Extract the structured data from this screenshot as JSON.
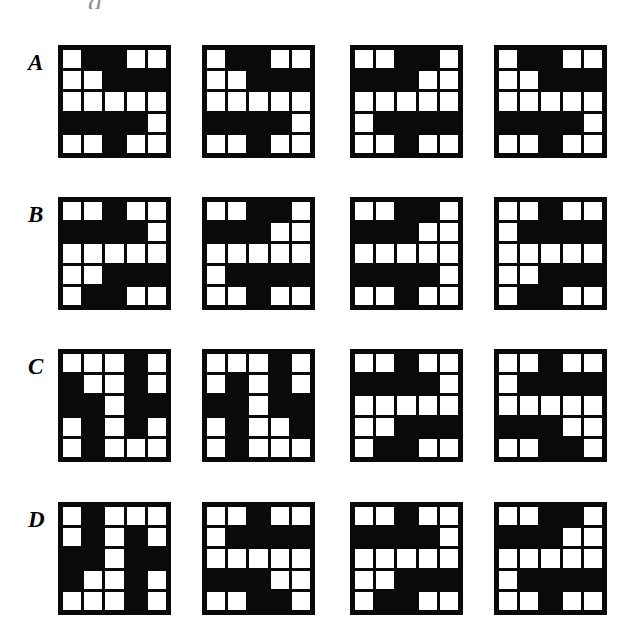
{
  "page": {
    "background_color": "#ffffff",
    "cell_white_color": "#ffffff",
    "cell_black_color": "#0a0a0a",
    "top_fragment_text": "g",
    "grid_rows": 5,
    "grid_cols": 5
  },
  "rows": [
    {
      "label": "A",
      "grids": [
        {
          "name": "grid-a-1",
          "matrix": [
            [
              "w",
              "b",
              "b",
              "w",
              "w"
            ],
            [
              "w",
              "w",
              "b",
              "b",
              "b"
            ],
            [
              "w",
              "w",
              "w",
              "w",
              "w"
            ],
            [
              "b",
              "b",
              "b",
              "b",
              "w"
            ],
            [
              "w",
              "w",
              "b",
              "w",
              "w"
            ]
          ]
        },
        {
          "name": "grid-a-2",
          "matrix": [
            [
              "w",
              "b",
              "b",
              "w",
              "w"
            ],
            [
              "w",
              "w",
              "b",
              "b",
              "b"
            ],
            [
              "w",
              "w",
              "w",
              "w",
              "w"
            ],
            [
              "b",
              "b",
              "b",
              "b",
              "w"
            ],
            [
              "w",
              "w",
              "b",
              "w",
              "w"
            ]
          ]
        },
        {
          "name": "grid-a-3",
          "matrix": [
            [
              "w",
              "w",
              "b",
              "b",
              "w"
            ],
            [
              "b",
              "b",
              "b",
              "w",
              "w"
            ],
            [
              "w",
              "w",
              "w",
              "w",
              "w"
            ],
            [
              "w",
              "b",
              "b",
              "b",
              "b"
            ],
            [
              "w",
              "w",
              "b",
              "w",
              "w"
            ]
          ]
        },
        {
          "name": "grid-a-4",
          "matrix": [
            [
              "w",
              "b",
              "b",
              "w",
              "w"
            ],
            [
              "w",
              "w",
              "b",
              "b",
              "b"
            ],
            [
              "w",
              "w",
              "w",
              "w",
              "w"
            ],
            [
              "b",
              "b",
              "b",
              "b",
              "w"
            ],
            [
              "w",
              "w",
              "b",
              "w",
              "w"
            ]
          ]
        }
      ]
    },
    {
      "label": "B",
      "grids": [
        {
          "name": "grid-b-1",
          "matrix": [
            [
              "w",
              "w",
              "b",
              "w",
              "w"
            ],
            [
              "b",
              "b",
              "b",
              "b",
              "w"
            ],
            [
              "w",
              "w",
              "w",
              "w",
              "w"
            ],
            [
              "w",
              "w",
              "b",
              "b",
              "b"
            ],
            [
              "w",
              "b",
              "b",
              "w",
              "w"
            ]
          ]
        },
        {
          "name": "grid-b-2",
          "matrix": [
            [
              "w",
              "w",
              "b",
              "b",
              "w"
            ],
            [
              "b",
              "b",
              "b",
              "w",
              "w"
            ],
            [
              "w",
              "w",
              "w",
              "w",
              "w"
            ],
            [
              "w",
              "b",
              "b",
              "b",
              "b"
            ],
            [
              "w",
              "w",
              "b",
              "w",
              "w"
            ]
          ]
        },
        {
          "name": "grid-b-3",
          "matrix": [
            [
              "w",
              "w",
              "b",
              "b",
              "w"
            ],
            [
              "b",
              "b",
              "b",
              "w",
              "w"
            ],
            [
              "w",
              "w",
              "w",
              "w",
              "w"
            ],
            [
              "b",
              "b",
              "b",
              "b",
              "w"
            ],
            [
              "w",
              "w",
              "b",
              "w",
              "w"
            ]
          ]
        },
        {
          "name": "grid-b-4",
          "matrix": [
            [
              "w",
              "w",
              "b",
              "w",
              "w"
            ],
            [
              "w",
              "b",
              "b",
              "b",
              "b"
            ],
            [
              "w",
              "w",
              "w",
              "w",
              "w"
            ],
            [
              "w",
              "w",
              "b",
              "b",
              "b"
            ],
            [
              "w",
              "b",
              "b",
              "w",
              "w"
            ]
          ]
        }
      ]
    },
    {
      "label": "C",
      "grids": [
        {
          "name": "grid-c-1",
          "matrix": [
            [
              "w",
              "w",
              "w",
              "b",
              "w"
            ],
            [
              "b",
              "w",
              "w",
              "b",
              "w"
            ],
            [
              "b",
              "b",
              "w",
              "b",
              "b"
            ],
            [
              "w",
              "b",
              "w",
              "b",
              "w"
            ],
            [
              "w",
              "b",
              "w",
              "w",
              "w"
            ]
          ]
        },
        {
          "name": "grid-c-2",
          "matrix": [
            [
              "w",
              "w",
              "w",
              "b",
              "w"
            ],
            [
              "w",
              "b",
              "w",
              "b",
              "w"
            ],
            [
              "b",
              "b",
              "w",
              "b",
              "b"
            ],
            [
              "w",
              "b",
              "w",
              "w",
              "b"
            ],
            [
              "w",
              "b",
              "w",
              "w",
              "w"
            ]
          ]
        },
        {
          "name": "grid-c-3",
          "matrix": [
            [
              "w",
              "w",
              "b",
              "w",
              "w"
            ],
            [
              "b",
              "b",
              "b",
              "b",
              "w"
            ],
            [
              "w",
              "w",
              "w",
              "w",
              "w"
            ],
            [
              "w",
              "w",
              "b",
              "b",
              "b"
            ],
            [
              "w",
              "b",
              "b",
              "w",
              "w"
            ]
          ]
        },
        {
          "name": "grid-c-4",
          "matrix": [
            [
              "w",
              "w",
              "b",
              "w",
              "w"
            ],
            [
              "w",
              "b",
              "b",
              "b",
              "b"
            ],
            [
              "w",
              "w",
              "w",
              "w",
              "w"
            ],
            [
              "b",
              "b",
              "b",
              "w",
              "w"
            ],
            [
              "w",
              "w",
              "b",
              "b",
              "w"
            ]
          ]
        }
      ]
    },
    {
      "label": "D",
      "grids": [
        {
          "name": "grid-d-1",
          "matrix": [
            [
              "w",
              "b",
              "w",
              "w",
              "w"
            ],
            [
              "w",
              "b",
              "w",
              "b",
              "w"
            ],
            [
              "b",
              "b",
              "w",
              "b",
              "b"
            ],
            [
              "b",
              "w",
              "w",
              "b",
              "w"
            ],
            [
              "w",
              "w",
              "w",
              "b",
              "w"
            ]
          ]
        },
        {
          "name": "grid-d-2",
          "matrix": [
            [
              "w",
              "w",
              "b",
              "w",
              "w"
            ],
            [
              "w",
              "b",
              "b",
              "b",
              "b"
            ],
            [
              "w",
              "w",
              "w",
              "w",
              "w"
            ],
            [
              "b",
              "b",
              "b",
              "w",
              "w"
            ],
            [
              "w",
              "w",
              "b",
              "b",
              "w"
            ]
          ]
        },
        {
          "name": "grid-d-3",
          "matrix": [
            [
              "w",
              "w",
              "b",
              "w",
              "w"
            ],
            [
              "b",
              "b",
              "b",
              "b",
              "w"
            ],
            [
              "w",
              "w",
              "w",
              "w",
              "w"
            ],
            [
              "w",
              "w",
              "b",
              "b",
              "b"
            ],
            [
              "w",
              "b",
              "b",
              "w",
              "w"
            ]
          ]
        },
        {
          "name": "grid-d-4",
          "matrix": [
            [
              "w",
              "w",
              "b",
              "b",
              "w"
            ],
            [
              "b",
              "b",
              "b",
              "w",
              "w"
            ],
            [
              "w",
              "w",
              "w",
              "w",
              "w"
            ],
            [
              "w",
              "b",
              "b",
              "b",
              "b"
            ],
            [
              "w",
              "w",
              "b",
              "w",
              "w"
            ]
          ]
        }
      ]
    }
  ]
}
